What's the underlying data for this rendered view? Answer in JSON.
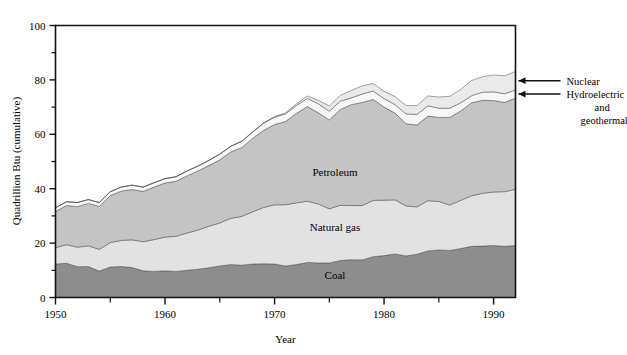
{
  "chart_data": {
    "type": "area",
    "stacked": true,
    "title": "",
    "xlabel": "Year",
    "ylabel": "Quadrillion Btu (cumulative)",
    "xlim": [
      1950,
      1992
    ],
    "ylim": [
      0,
      100
    ],
    "grid": false,
    "legend_position": "inline-labels-and-right-arrows",
    "x_major_ticks": [
      1950,
      1960,
      1970,
      1980,
      1990
    ],
    "x_major_tick_labels": [
      "1950",
      "1960",
      "1970",
      "1980",
      "1990"
    ],
    "x_minor_ticks": [
      1955,
      1965,
      1975,
      1985
    ],
    "y_major_ticks": [
      0,
      20,
      40,
      60,
      80,
      100
    ],
    "y_major_tick_labels": [
      "0",
      "20",
      "40",
      "60",
      "80",
      "100"
    ],
    "y_minor_ticks": [
      10,
      30,
      50,
      70,
      90
    ],
    "x": [
      1950,
      1951,
      1952,
      1953,
      1954,
      1955,
      1956,
      1957,
      1958,
      1959,
      1960,
      1961,
      1962,
      1963,
      1964,
      1965,
      1966,
      1967,
      1968,
      1969,
      1970,
      1971,
      1972,
      1973,
      1974,
      1975,
      1976,
      1977,
      1978,
      1979,
      1980,
      1981,
      1982,
      1983,
      1984,
      1985,
      1986,
      1987,
      1988,
      1989,
      1990,
      1991,
      1992
    ],
    "series": [
      {
        "name": "Coal",
        "color": "#8d8d8d",
        "label_inside": "Coal",
        "values": [
          12.3,
          12.6,
          11.3,
          11.4,
          9.7,
          11.2,
          11.4,
          11.0,
          9.8,
          9.6,
          9.8,
          9.6,
          10.0,
          10.4,
          10.9,
          11.6,
          12.1,
          11.9,
          12.3,
          12.4,
          12.3,
          11.6,
          12.1,
          12.9,
          12.7,
          12.7,
          13.6,
          13.9,
          13.8,
          15.0,
          15.4,
          16.0,
          15.3,
          15.9,
          17.1,
          17.5,
          17.3,
          18.0,
          18.8,
          18.9,
          19.1,
          18.8,
          19.1
        ]
      },
      {
        "name": "Natural gas",
        "color": "#e2e2e2",
        "label_inside": "Natural gas",
        "values": [
          6.0,
          6.8,
          7.2,
          7.6,
          8.0,
          9.0,
          9.6,
          10.2,
          10.7,
          11.7,
          12.4,
          12.9,
          13.7,
          14.4,
          15.3,
          15.8,
          17.0,
          17.9,
          19.2,
          20.7,
          21.8,
          22.5,
          22.7,
          22.5,
          21.7,
          19.9,
          20.3,
          19.9,
          20.0,
          20.7,
          20.4,
          19.9,
          18.4,
          17.4,
          18.5,
          17.8,
          16.7,
          17.7,
          18.6,
          19.4,
          19.7,
          20.1,
          20.7
        ]
      },
      {
        "name": "Petroleum",
        "color": "#c4c4c4",
        "label_inside": "Petroleum",
        "values": [
          13.3,
          14.4,
          14.9,
          15.6,
          15.8,
          17.3,
          18.1,
          18.5,
          18.5,
          19.3,
          19.9,
          20.2,
          21.0,
          21.7,
          22.3,
          23.2,
          24.4,
          25.3,
          27.0,
          28.3,
          29.5,
          30.6,
          32.9,
          34.8,
          33.5,
          32.7,
          35.2,
          37.1,
          37.9,
          37.1,
          34.2,
          31.9,
          30.2,
          30.1,
          31.1,
          30.9,
          32.2,
          32.9,
          34.2,
          34.2,
          33.6,
          32.8,
          33.5
        ]
      },
      {
        "name": "Hydroelectric and geothermal",
        "color": "#f7f7f7",
        "annotation": "Hydroelectric and geothermal",
        "values": [
          1.4,
          1.4,
          1.5,
          1.4,
          1.4,
          1.4,
          1.5,
          1.6,
          1.6,
          1.6,
          1.6,
          1.7,
          1.8,
          1.8,
          1.9,
          2.1,
          2.1,
          2.3,
          2.3,
          2.7,
          2.7,
          2.8,
          2.9,
          3.0,
          3.3,
          3.2,
          3.1,
          2.5,
          3.1,
          3.1,
          3.1,
          3.1,
          3.6,
          3.9,
          3.8,
          3.4,
          3.4,
          3.0,
          2.6,
          3.0,
          3.2,
          3.2,
          3.0
        ]
      },
      {
        "name": "Nuclear",
        "color": "#eaeaea",
        "annotation": "Nuclear",
        "values": [
          0.0,
          0.0,
          0.0,
          0.0,
          0.0,
          0.0,
          0.0,
          0.0,
          0.0,
          0.0,
          0.0,
          0.0,
          0.0,
          0.0,
          0.0,
          0.0,
          0.0,
          0.1,
          0.1,
          0.1,
          0.2,
          0.4,
          0.6,
          0.9,
          1.3,
          1.9,
          2.1,
          2.7,
          3.0,
          2.8,
          2.7,
          3.0,
          3.1,
          3.2,
          3.6,
          4.1,
          4.4,
          4.9,
          5.6,
          5.7,
          6.2,
          6.6,
          6.8
        ]
      }
    ],
    "annotations": [
      {
        "text": "Nuclear",
        "lines": [
          "Nuclear"
        ]
      },
      {
        "text": "Hydroelectric and geothermal",
        "lines": [
          "Hydroelectric",
          "and",
          "geothermal"
        ]
      }
    ]
  }
}
